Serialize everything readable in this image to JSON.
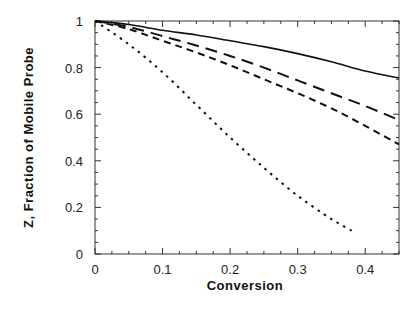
{
  "chart_data": {
    "type": "line",
    "title": "",
    "xlabel": "Conversion",
    "ylabel": "Z, Fraction of Mobile Probe",
    "xlim": [
      0,
      0.45
    ],
    "ylim": [
      0,
      1
    ],
    "xticks": [
      "0",
      "0.1",
      "0.2",
      "0.3",
      "0.4"
    ],
    "yticks": [
      "0",
      "0.2",
      "0.4",
      "0.6",
      "0.8",
      "1"
    ],
    "grid": false,
    "legend": null,
    "series": [
      {
        "name": "solid",
        "style": "solid",
        "x": [
          0,
          0.05,
          0.1,
          0.15,
          0.2,
          0.25,
          0.3,
          0.35,
          0.4,
          0.45
        ],
        "y": [
          1.0,
          0.985,
          0.96,
          0.94,
          0.915,
          0.89,
          0.86,
          0.825,
          0.785,
          0.755
        ]
      },
      {
        "name": "long-dash",
        "style": "long-dash",
        "x": [
          0,
          0.05,
          0.1,
          0.15,
          0.2,
          0.25,
          0.3,
          0.35,
          0.4,
          0.45
        ],
        "y": [
          1.0,
          0.975,
          0.935,
          0.895,
          0.85,
          0.8,
          0.745,
          0.69,
          0.635,
          0.575
        ]
      },
      {
        "name": "short-dash",
        "style": "short-dash",
        "x": [
          0,
          0.05,
          0.1,
          0.15,
          0.2,
          0.25,
          0.3,
          0.35,
          0.4,
          0.45
        ],
        "y": [
          1.0,
          0.965,
          0.915,
          0.865,
          0.81,
          0.75,
          0.69,
          0.625,
          0.55,
          0.47
        ]
      },
      {
        "name": "dotted",
        "style": "dotted",
        "x": [
          0,
          0.05,
          0.1,
          0.15,
          0.2,
          0.25,
          0.3,
          0.35,
          0.38
        ],
        "y": [
          1.0,
          0.9,
          0.78,
          0.64,
          0.5,
          0.37,
          0.25,
          0.15,
          0.1
        ]
      }
    ]
  }
}
